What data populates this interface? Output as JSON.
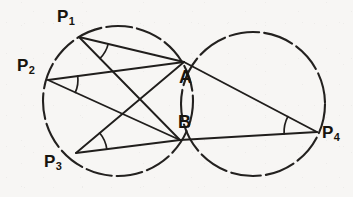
{
  "figure": {
    "background_color": "#f7f6f4",
    "stroke_color": "#201e1c",
    "canvas": {
      "width": 353,
      "height": 197
    }
  },
  "labels": {
    "p1": {
      "text": "P",
      "sub": "1",
      "x": 57,
      "y": 8
    },
    "p2": {
      "text": "P",
      "sub": "2",
      "x": 17,
      "y": 57
    },
    "p3": {
      "text": "P",
      "sub": "3",
      "x": 44,
      "y": 153
    },
    "p4": {
      "text": "P",
      "sub": "4",
      "x": 322,
      "y": 124
    },
    "a": {
      "text": "A",
      "x": 179,
      "y": 68
    },
    "b": {
      "text": "B",
      "x": 178,
      "y": 113
    }
  },
  "points": {
    "P1": {
      "x": 79,
      "y": 37
    },
    "P2": {
      "x": 48,
      "y": 80
    },
    "P3": {
      "x": 76,
      "y": 153
    },
    "P4": {
      "x": 317,
      "y": 132
    },
    "A": {
      "x": 184,
      "y": 62
    },
    "B": {
      "x": 180,
      "y": 140
    }
  },
  "circles": [
    {
      "name": "left-circle",
      "cx": 118,
      "cy": 101,
      "r": 75
    },
    {
      "name": "right-circle",
      "cx": 253,
      "cy": 104,
      "r": 72
    }
  ],
  "chords": [
    {
      "name": "chord-p1-a",
      "from": "P1",
      "to": "A"
    },
    {
      "name": "chord-p1-b",
      "from": "P1",
      "to": "B"
    },
    {
      "name": "chord-p2-a",
      "from": "P2",
      "to": "A"
    },
    {
      "name": "chord-p2-b",
      "from": "P2",
      "to": "B"
    },
    {
      "name": "chord-p3-a",
      "from": "P3",
      "to": "A"
    },
    {
      "name": "chord-p3-b",
      "from": "P3",
      "to": "B"
    },
    {
      "name": "chord-p4-a",
      "from": "P4",
      "to": "A"
    },
    {
      "name": "chord-p4-b",
      "from": "P4",
      "to": "B"
    }
  ],
  "angle_marks": [
    {
      "name": "angle-at-p1",
      "vertex": "P1",
      "radius": 30
    },
    {
      "name": "angle-at-p2",
      "vertex": "P2",
      "radius": 30
    },
    {
      "name": "angle-at-p3",
      "vertex": "P3",
      "radius": 31
    },
    {
      "name": "angle-at-p4",
      "vertex": "P4",
      "radius": 33
    }
  ]
}
